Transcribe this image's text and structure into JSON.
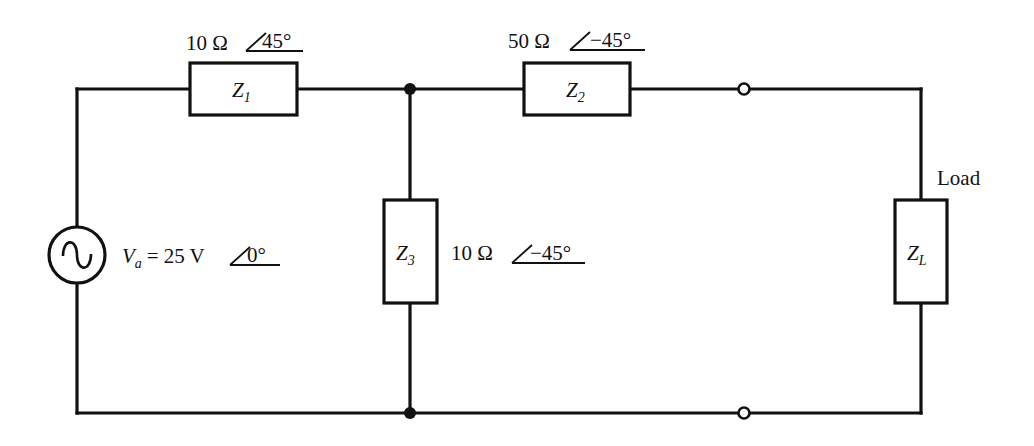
{
  "diagram": {
    "type": "ac-circuit-schematic",
    "source": {
      "symbol": "V",
      "subscript": "a",
      "equals": "=",
      "magnitude": "25 V",
      "angle": "0°"
    },
    "components": {
      "z1": {
        "symbol": "Z",
        "subscript": "1",
        "magnitude": "10 Ω",
        "angle": "45°"
      },
      "z2": {
        "symbol": "Z",
        "subscript": "2",
        "magnitude": "50 Ω",
        "angle": "−45°"
      },
      "z3": {
        "symbol": "Z",
        "subscript": "3",
        "magnitude": "10 Ω",
        "angle": "−45°"
      },
      "zl": {
        "symbol": "Z",
        "subscript": "L",
        "label": "Load"
      }
    }
  }
}
